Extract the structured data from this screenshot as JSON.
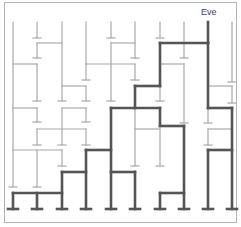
{
  "diagram": {
    "type": "amidakuji-ladder",
    "start_label": "Eve",
    "start_column": 8,
    "colors": {
      "thin": "#a8a8a8",
      "thick": "#555555",
      "border": "#b4b4b4",
      "label": "#444444"
    },
    "columns_x": [
      13,
      37,
      62,
      86,
      111,
      135,
      160,
      184,
      208,
      232
    ],
    "top_y": 22,
    "bottom_y": 209,
    "thin_segments": [
      [
        13,
        22,
        13,
        187
      ],
      [
        37,
        22,
        37,
        38
      ],
      [
        37,
        43,
        37,
        58
      ],
      [
        37,
        64,
        37,
        101
      ],
      [
        37,
        108,
        37,
        122
      ],
      [
        37,
        129,
        37,
        145
      ],
      [
        37,
        150,
        37,
        187
      ],
      [
        62,
        22,
        62,
        101
      ],
      [
        62,
        108,
        62,
        145
      ],
      [
        62,
        150,
        62,
        166
      ],
      [
        86,
        22,
        86,
        80
      ],
      [
        86,
        86,
        86,
        101
      ],
      [
        86,
        108,
        86,
        122
      ],
      [
        86,
        129,
        86,
        145
      ],
      [
        111,
        22,
        111,
        38
      ],
      [
        111,
        43,
        111,
        101
      ],
      [
        135,
        22,
        135,
        58
      ],
      [
        135,
        64,
        135,
        80
      ],
      [
        135,
        108,
        135,
        166
      ],
      [
        160,
        22,
        160,
        38
      ],
      [
        160,
        86,
        160,
        101
      ],
      [
        160,
        129,
        160,
        166
      ],
      [
        184,
        22,
        184,
        58
      ],
      [
        184,
        64,
        184,
        123
      ],
      [
        208,
        108,
        208,
        123
      ],
      [
        208,
        129,
        208,
        145
      ],
      [
        232,
        22,
        232,
        82
      ],
      [
        232,
        86,
        232,
        103
      ],
      [
        37,
        43,
        62,
        43
      ],
      [
        13,
        64,
        37,
        64
      ],
      [
        62,
        86,
        86,
        86
      ],
      [
        111,
        43,
        135,
        43
      ],
      [
        86,
        64,
        135,
        64
      ],
      [
        160,
        64,
        184,
        64
      ],
      [
        208,
        86,
        232,
        86
      ],
      [
        13,
        108,
        37,
        108
      ],
      [
        62,
        108,
        86,
        108
      ],
      [
        37,
        129,
        86,
        129
      ],
      [
        13,
        150,
        62,
        150
      ],
      [
        135,
        129,
        160,
        129
      ],
      [
        208,
        129,
        232,
        129
      ]
    ],
    "thick_segments": [
      [
        208,
        22,
        208,
        43
      ],
      [
        160,
        43,
        208,
        43
      ],
      [
        208,
        43,
        208,
        108
      ],
      [
        160,
        43,
        160,
        86
      ],
      [
        135,
        86,
        160,
        86
      ],
      [
        135,
        86,
        135,
        108
      ],
      [
        111,
        108,
        160,
        108
      ],
      [
        160,
        108,
        160,
        126
      ],
      [
        160,
        126,
        184,
        126
      ],
      [
        184,
        126,
        184,
        209
      ],
      [
        208,
        108,
        232,
        108
      ],
      [
        232,
        108,
        232,
        209
      ],
      [
        208,
        150,
        232,
        150
      ],
      [
        208,
        150,
        208,
        209
      ],
      [
        111,
        108,
        111,
        209
      ],
      [
        86,
        150,
        111,
        150
      ],
      [
        86,
        150,
        86,
        209
      ],
      [
        62,
        172,
        86,
        172
      ],
      [
        62,
        172,
        62,
        209
      ],
      [
        111,
        172,
        135,
        172
      ],
      [
        135,
        172,
        135,
        209
      ],
      [
        160,
        193,
        184,
        193
      ],
      [
        160,
        193,
        160,
        209
      ],
      [
        13,
        193,
        62,
        193
      ],
      [
        13,
        193,
        13,
        209
      ],
      [
        37,
        193,
        37,
        209
      ]
    ],
    "thin_ticks": [
      [
        37,
        38
      ],
      [
        111,
        38
      ],
      [
        160,
        38
      ],
      [
        37,
        58
      ],
      [
        135,
        58
      ],
      [
        184,
        58
      ],
      [
        86,
        80
      ],
      [
        135,
        80
      ],
      [
        232,
        82
      ],
      [
        37,
        101
      ],
      [
        62,
        101
      ],
      [
        86,
        101
      ],
      [
        111,
        101
      ],
      [
        160,
        101
      ],
      [
        232,
        103
      ],
      [
        37,
        122
      ],
      [
        86,
        122
      ],
      [
        184,
        123
      ],
      [
        208,
        123
      ],
      [
        37,
        145
      ],
      [
        62,
        145
      ],
      [
        86,
        145
      ],
      [
        208,
        145
      ],
      [
        62,
        166
      ],
      [
        135,
        166
      ],
      [
        160,
        166
      ],
      [
        13,
        187
      ],
      [
        37,
        187
      ]
    ],
    "thick_ticks": [
      [
        13,
        209
      ],
      [
        37,
        209
      ],
      [
        62,
        209
      ],
      [
        86,
        209
      ],
      [
        111,
        209
      ],
      [
        135,
        209
      ],
      [
        160,
        209
      ],
      [
        184,
        209
      ],
      [
        208,
        209
      ],
      [
        232,
        209
      ]
    ]
  }
}
